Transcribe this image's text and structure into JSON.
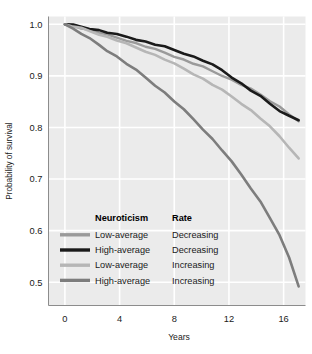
{
  "chart_data": {
    "type": "line",
    "title": "",
    "xlabel": "Years",
    "ylabel": "Probability of survival",
    "xlim": [
      -1.2,
      17.6
    ],
    "ylim": [
      0.455,
      1.015
    ],
    "xticks": [
      0,
      4,
      8,
      12,
      16
    ],
    "xticklabels": [
      "0",
      "4",
      "8",
      "12",
      "16"
    ],
    "yticks": [
      0.5,
      0.6,
      0.7,
      0.8,
      0.9,
      1.0
    ],
    "yticklabels": [
      "0.5",
      "0.6",
      "0.7",
      "0.8",
      "0.9",
      "1.0"
    ],
    "grid": true,
    "grid_color": "#ffffff",
    "plot_background": "#ebebeb",
    "legend_position": "lower-left-inside",
    "legend_columns": [
      "Neuroticism",
      "Rate"
    ],
    "series": [
      {
        "name": "Low-average Decreasing",
        "neuroticism": "Low-average",
        "rate": "Decreasing",
        "color": "#9a9a9a",
        "width": 2.4,
        "x": [
          0,
          0.6,
          1.2,
          1.8,
          2.5,
          3.1,
          3.8,
          4.5,
          5.2,
          5.9,
          6.6,
          7.3,
          8.0,
          8.7,
          9.4,
          10.1,
          10.8,
          11.5,
          12.2,
          12.9,
          13.6,
          14.3,
          15.0,
          15.7,
          16.4,
          17.1
        ],
        "y": [
          1.0,
          0.997,
          0.993,
          0.989,
          0.984,
          0.979,
          0.974,
          0.969,
          0.963,
          0.957,
          0.951,
          0.945,
          0.938,
          0.931,
          0.924,
          0.917,
          0.909,
          0.901,
          0.892,
          0.883,
          0.874,
          0.864,
          0.852,
          0.84,
          0.826,
          0.812
        ]
      },
      {
        "name": "High-average Decreasing",
        "neuroticism": "High-average",
        "rate": "Decreasing",
        "color": "#1a1a1a",
        "width": 2.6,
        "x": [
          0,
          0.6,
          1.2,
          1.8,
          2.5,
          3.1,
          3.8,
          4.5,
          5.2,
          5.9,
          6.6,
          7.3,
          8.0,
          8.7,
          9.4,
          10.1,
          10.8,
          11.5,
          12.2,
          12.9,
          13.6,
          14.3,
          15.0,
          15.7,
          16.4,
          17.1
        ],
        "y": [
          1.0,
          0.998,
          0.995,
          0.992,
          0.988,
          0.984,
          0.98,
          0.976,
          0.971,
          0.966,
          0.961,
          0.956,
          0.95,
          0.944,
          0.937,
          0.93,
          0.921,
          0.911,
          0.898,
          0.885,
          0.872,
          0.86,
          0.846,
          0.833,
          0.822,
          0.814
        ]
      },
      {
        "name": "Low-average Increasing",
        "neuroticism": "Low-average",
        "rate": "Increasing",
        "color": "#b6b6b6",
        "width": 2.6,
        "x": [
          0,
          0.6,
          1.2,
          1.8,
          2.5,
          3.1,
          3.8,
          4.5,
          5.2,
          5.9,
          6.6,
          7.3,
          8.0,
          8.7,
          9.4,
          10.1,
          10.8,
          11.5,
          12.2,
          12.9,
          13.6,
          14.3,
          15.0,
          15.7,
          16.4,
          17.1
        ],
        "y": [
          1.0,
          0.996,
          0.992,
          0.987,
          0.981,
          0.975,
          0.969,
          0.962,
          0.955,
          0.948,
          0.94,
          0.932,
          0.923,
          0.914,
          0.904,
          0.894,
          0.883,
          0.872,
          0.86,
          0.847,
          0.833,
          0.818,
          0.801,
          0.783,
          0.762,
          0.74
        ]
      },
      {
        "name": "High-average Increasing",
        "neuroticism": "High-average",
        "rate": "Increasing",
        "color": "#7d7d7d",
        "width": 2.6,
        "x": [
          0,
          0.6,
          1.2,
          1.8,
          2.5,
          3.1,
          3.8,
          4.5,
          5.2,
          5.9,
          6.6,
          7.3,
          8.0,
          8.7,
          9.4,
          10.1,
          10.8,
          11.5,
          12.2,
          12.9,
          13.6,
          14.3,
          15.0,
          15.7,
          16.4,
          17.1
        ],
        "y": [
          1.0,
          0.991,
          0.982,
          0.972,
          0.96,
          0.949,
          0.937,
          0.924,
          0.911,
          0.897,
          0.882,
          0.867,
          0.851,
          0.834,
          0.816,
          0.797,
          0.777,
          0.756,
          0.733,
          0.709,
          0.683,
          0.656,
          0.625,
          0.59,
          0.548,
          0.492
        ]
      }
    ]
  },
  "legend": {
    "header_neuroticism": "Neuroticism",
    "header_rate": "Rate",
    "rows": [
      {
        "neuroticism": "Low-average",
        "rate": "Decreasing"
      },
      {
        "neuroticism": "High-average",
        "rate": "Decreasing"
      },
      {
        "neuroticism": "Low-average",
        "rate": "Increasing"
      },
      {
        "neuroticism": "High-average",
        "rate": "Increasing"
      }
    ]
  },
  "axes": {
    "x_title": "Years",
    "y_title": "Probability of survival"
  }
}
